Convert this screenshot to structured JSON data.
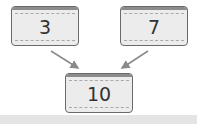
{
  "diagram": {
    "type": "number-bond",
    "parts": [
      {
        "label": "3"
      },
      {
        "label": "7"
      }
    ],
    "whole": {
      "label": "10"
    }
  },
  "colors": {
    "box_fill": "#ececec",
    "box_border": "#6a6a6a",
    "arrow": "#8a8a8a",
    "band": "#e4e4e4"
  }
}
